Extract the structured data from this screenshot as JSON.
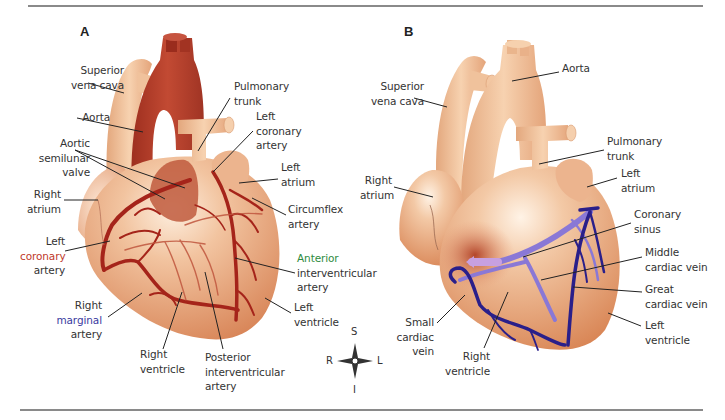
{
  "figure": {
    "width": 725,
    "height": 420,
    "top_rule": {
      "x1": 28,
      "x2": 703,
      "y": 5
    },
    "bottom_rule": {
      "x1": 20,
      "x2": 703,
      "y": 410
    },
    "colors": {
      "heart_a_body": "#e9a37c",
      "heart_a_highlight": "#fbe3cf",
      "heart_a_aorta": "#b5402e",
      "heart_a_vessel": "#f0c09a",
      "artery": "#a5241a",
      "heart_b_body": "#e6a37a",
      "heart_b_highlight": "#fbe6d3",
      "heart_b_vessel": "#f1c596",
      "vein_dark": "#2a1f8a",
      "vein_light": "#8a78d6",
      "leader": "#222222",
      "label_text": "#333333",
      "accent_red": "#c0392b",
      "accent_blue": "#3a3aa0",
      "accent_green": "#2e8b3e"
    }
  },
  "panels": [
    {
      "id": "A",
      "letter": "A",
      "letter_pos": {
        "x": 80,
        "y": 24
      },
      "labels": [
        {
          "name": "superior-vena-cava",
          "lines": [
            "Superior",
            "vena cava"
          ],
          "x": 38,
          "y": 63,
          "align": "r",
          "w": 86
        },
        {
          "name": "aorta",
          "lines": [
            "Aorta"
          ],
          "x": 38,
          "y": 110,
          "align": "r",
          "w": 72
        },
        {
          "name": "aortic-semilunar-valve",
          "lines": [
            "Aortic",
            "semilunar",
            "valve"
          ],
          "x": 15,
          "y": 136,
          "align": "r",
          "w": 75
        },
        {
          "name": "right-atrium",
          "lines": [
            "Right",
            "atrium"
          ],
          "x": 15,
          "y": 187,
          "align": "r",
          "w": 46
        },
        {
          "name": "left-coronary-artery-a1",
          "lines": [
            "Left",
            "coronary",
            "artery"
          ],
          "x": 20,
          "y": 234,
          "align": "r",
          "w": 45,
          "color_line": 1,
          "color": "accent_red"
        },
        {
          "name": "right-marginal-artery",
          "lines": [
            "Right",
            "marginal",
            "artery"
          ],
          "x": 40,
          "y": 298,
          "align": "r",
          "w": 62,
          "color_line": 1,
          "color": "accent_blue"
        },
        {
          "name": "right-ventricle-a",
          "lines": [
            "Right",
            "ventricle"
          ],
          "x": 140,
          "y": 347,
          "align": "l",
          "w": 60
        },
        {
          "name": "posterior-interventricular-artery",
          "lines": [
            "Posterior",
            "interventricular",
            "artery"
          ],
          "x": 205,
          "y": 350,
          "align": "l",
          "w": 90
        },
        {
          "name": "pulmonary-trunk-a",
          "lines": [
            "Pulmonary",
            "trunk"
          ],
          "x": 234,
          "y": 79,
          "align": "l",
          "w": 70
        },
        {
          "name": "left-coronary-artery-a2",
          "lines": [
            "Left",
            "coronary",
            "artery"
          ],
          "x": 256,
          "y": 109,
          "align": "l",
          "w": 60
        },
        {
          "name": "left-atrium-a",
          "lines": [
            "Left",
            "atrium"
          ],
          "x": 281,
          "y": 160,
          "align": "l",
          "w": 50
        },
        {
          "name": "circumflex-artery",
          "lines": [
            "Circumflex",
            "artery"
          ],
          "x": 288,
          "y": 202,
          "align": "l",
          "w": 70
        },
        {
          "name": "anterior-interventricular-artery",
          "lines": [
            "Anterior",
            "interventricular",
            "artery"
          ],
          "x": 297,
          "y": 251,
          "align": "l",
          "w": 90,
          "color_line": 0,
          "color": "accent_green"
        },
        {
          "name": "left-ventricle-a",
          "lines": [
            "Left",
            "ventricle"
          ],
          "x": 294,
          "y": 300,
          "align": "l",
          "w": 60
        }
      ],
      "leaders": [
        [
          [
            88,
            83
          ],
          [
            124,
            93
          ]
        ],
        [
          [
            77,
            118
          ],
          [
            143,
            132
          ]
        ],
        [
          [
            75,
            150
          ],
          [
            185,
            188
          ]
        ],
        [
          [
            75,
            150
          ],
          [
            165,
            199
          ]
        ],
        [
          [
            64,
            200
          ],
          [
            98,
            200
          ]
        ],
        [
          [
            65,
            251
          ],
          [
            110,
            241
          ]
        ],
        [
          [
            108,
            317
          ],
          [
            142,
            293
          ]
        ],
        [
          [
            163,
            349
          ],
          [
            182,
            292
          ]
        ],
        [
          [
            223,
            349
          ],
          [
            205,
            272
          ]
        ],
        [
          [
            230,
            98
          ],
          [
            198,
            151
          ]
        ],
        [
          [
            253,
            131
          ],
          [
            213,
            172
          ]
        ],
        [
          [
            278,
            179
          ],
          [
            239,
            183
          ]
        ],
        [
          [
            286,
            215
          ],
          [
            252,
            198
          ]
        ],
        [
          [
            295,
            273
          ],
          [
            235,
            258
          ]
        ],
        [
          [
            291,
            313
          ],
          [
            265,
            298
          ]
        ]
      ]
    },
    {
      "id": "B",
      "letter": "B",
      "letter_pos": {
        "x": 404,
        "y": 24
      },
      "labels": [
        {
          "name": "aorta-b",
          "lines": [
            "Aorta"
          ],
          "x": 562,
          "y": 61,
          "align": "l",
          "w": 50
        },
        {
          "name": "superior-vena-cava-b",
          "lines": [
            "Superior",
            "vena cava"
          ],
          "x": 360,
          "y": 79,
          "align": "r",
          "w": 64
        },
        {
          "name": "right-atrium-b",
          "lines": [
            "Right",
            "atrium"
          ],
          "x": 360,
          "y": 173,
          "align": "r",
          "w": 32
        },
        {
          "name": "pulmonary-trunk-b",
          "lines": [
            "Pulmonary",
            "trunk"
          ],
          "x": 607,
          "y": 134,
          "align": "l",
          "w": 70
        },
        {
          "name": "left-atrium-b",
          "lines": [
            "Left",
            "atrium"
          ],
          "x": 621,
          "y": 166,
          "align": "l",
          "w": 50
        },
        {
          "name": "coronary-sinus",
          "lines": [
            "Coronary",
            "sinus"
          ],
          "x": 634,
          "y": 207,
          "align": "l",
          "w": 60
        },
        {
          "name": "middle-cardiac-vein",
          "lines": [
            "Middle",
            "cardiac vein"
          ],
          "x": 645,
          "y": 245,
          "align": "l",
          "w": 80
        },
        {
          "name": "great-cardiac-vein",
          "lines": [
            "Great",
            "cardiac vein"
          ],
          "x": 645,
          "y": 282,
          "align": "l",
          "w": 80
        },
        {
          "name": "left-ventricle-b",
          "lines": [
            "Left",
            "ventricle"
          ],
          "x": 645,
          "y": 318,
          "align": "l",
          "w": 60
        },
        {
          "name": "small-cardiac-vein",
          "lines": [
            "Small",
            "cardiac",
            "vein"
          ],
          "x": 380,
          "y": 315,
          "align": "r",
          "w": 54
        },
        {
          "name": "right-ventricle-b",
          "lines": [
            "Right",
            "ventricle"
          ],
          "x": 440,
          "y": 349,
          "align": "r",
          "w": 50
        }
      ],
      "leaders": [
        [
          [
            559,
            72
          ],
          [
            512,
            81
          ]
        ],
        [
          [
            414,
            98
          ],
          [
            447,
            107
          ]
        ],
        [
          [
            394,
            187
          ],
          [
            433,
            197
          ]
        ],
        [
          [
            604,
            150
          ],
          [
            539,
            164
          ]
        ],
        [
          [
            617,
            178
          ],
          [
            587,
            187
          ]
        ],
        [
          [
            631,
            223
          ],
          [
            523,
            257
          ]
        ],
        [
          [
            642,
            257
          ],
          [
            541,
            280
          ]
        ],
        [
          [
            642,
            292
          ],
          [
            573,
            287
          ]
        ],
        [
          [
            641,
            326
          ],
          [
            608,
            313
          ]
        ],
        [
          [
            437,
            323
          ],
          [
            465,
            295
          ]
        ],
        [
          [
            484,
            348
          ],
          [
            508,
            292
          ]
        ]
      ]
    }
  ],
  "compass": {
    "cx": 355,
    "cy": 361,
    "labels": {
      "top": "S",
      "bottom": "I",
      "left": "R",
      "right": "L"
    }
  }
}
